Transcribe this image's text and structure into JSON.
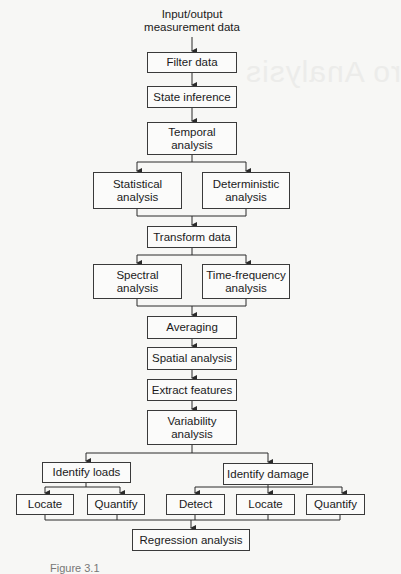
{
  "diagram": {
    "type": "flowchart",
    "input_label": "Input/output\nmeasurement data",
    "nodes": {
      "filter_data": "Filter data",
      "state_inference": "State inference",
      "temporal_analysis": "Temporal\nanalysis",
      "statistical_analysis": "Statistical\nanalysis",
      "deterministic_analysis": "Deterministic\nanalysis",
      "transform_data": "Transform data",
      "spectral_analysis": "Spectral\nanalysis",
      "time_frequency_analysis": "Time-frequency\nanalysis",
      "averaging": "Averaging",
      "spatial_analysis": "Spatial analysis",
      "extract_features": "Extract features",
      "variability_analysis": "Variability\nanalysis",
      "identify_loads": "Identify loads",
      "loads_locate": "Locate",
      "loads_quantify": "Quantify",
      "identify_damage": "Identify damage",
      "damage_detect": "Detect",
      "damage_locate": "Locate",
      "damage_quantify": "Quantify",
      "regression_analysis": "Regression analysis"
    },
    "edges": [
      [
        "input",
        "filter_data"
      ],
      [
        "filter_data",
        "state_inference"
      ],
      [
        "state_inference",
        "temporal_analysis"
      ],
      [
        "temporal_analysis",
        "statistical_analysis"
      ],
      [
        "temporal_analysis",
        "deterministic_analysis"
      ],
      [
        "statistical_analysis",
        "transform_data"
      ],
      [
        "deterministic_analysis",
        "transform_data"
      ],
      [
        "transform_data",
        "spectral_analysis"
      ],
      [
        "transform_data",
        "time_frequency_analysis"
      ],
      [
        "spectral_analysis",
        "averaging"
      ],
      [
        "time_frequency_analysis",
        "averaging"
      ],
      [
        "averaging",
        "spatial_analysis"
      ],
      [
        "spatial_analysis",
        "extract_features"
      ],
      [
        "extract_features",
        "variability_analysis"
      ],
      [
        "variability_analysis",
        "identify_loads"
      ],
      [
        "variability_analysis",
        "identify_damage"
      ],
      [
        "identify_loads",
        "loads_locate"
      ],
      [
        "identify_loads",
        "loads_quantify"
      ],
      [
        "identify_damage",
        "damage_detect"
      ],
      [
        "identify_damage",
        "damage_locate"
      ],
      [
        "identify_damage",
        "damage_quantify"
      ],
      [
        "loads_locate",
        "regression_analysis"
      ],
      [
        "loads_quantify",
        "regression_analysis"
      ],
      [
        "damage_detect",
        "regression_analysis"
      ],
      [
        "damage_locate",
        "regression_analysis"
      ],
      [
        "damage_quantify",
        "regression_analysis"
      ]
    ],
    "caption": "Figure 3.1"
  },
  "background_bleed_text": "ro Analysis",
  "colors": {
    "line": "#2a2a2a",
    "box_border": "#3a3a3a",
    "page": "#f7f7f5"
  }
}
